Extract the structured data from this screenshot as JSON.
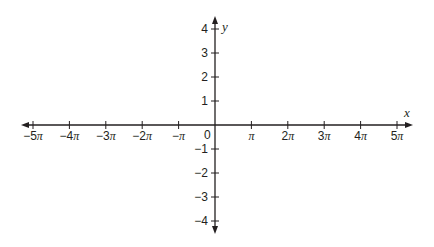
{
  "chart_data": {
    "type": "line",
    "title": "",
    "xlabel": "x",
    "ylabel": "y",
    "xlim": [
      "-5π",
      "5π"
    ],
    "ylim": [
      -4,
      4
    ],
    "grid": false,
    "legend": null,
    "x_ticks": [
      {
        "value": -5,
        "label": "−5π"
      },
      {
        "value": -4,
        "label": "−4π"
      },
      {
        "value": -3,
        "label": "−3π"
      },
      {
        "value": -2,
        "label": "−2π"
      },
      {
        "value": -1,
        "label": "−π"
      },
      {
        "value": 1,
        "label": "π"
      },
      {
        "value": 2,
        "label": "2π"
      },
      {
        "value": 3,
        "label": "3π"
      },
      {
        "value": 4,
        "label": "4π"
      },
      {
        "value": 5,
        "label": "5π"
      }
    ],
    "y_ticks": [
      {
        "value": 4,
        "label": "4"
      },
      {
        "value": 3,
        "label": "3"
      },
      {
        "value": 2,
        "label": "2"
      },
      {
        "value": 1,
        "label": "1"
      },
      {
        "value": -1,
        "label": "−1"
      },
      {
        "value": -2,
        "label": "−2"
      },
      {
        "value": -3,
        "label": "−3"
      },
      {
        "value": -4,
        "label": "−4"
      }
    ],
    "origin_label": "0",
    "series": []
  },
  "colors": {
    "axis": "#231f20",
    "background": "#ffffff"
  }
}
